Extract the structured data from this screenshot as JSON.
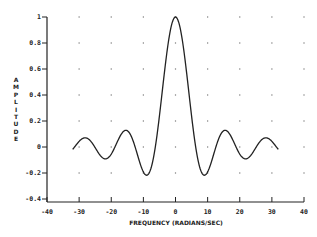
{
  "chart_data": {
    "type": "line",
    "title": "",
    "xlabel": "FREQUENCY (RADIANS/SEC)",
    "ylabel": "AMPLITUDE",
    "xlim": [
      -40,
      40
    ],
    "ylim": [
      -0.4,
      1
    ],
    "xticks": [
      -40,
      -30,
      -20,
      -10,
      0,
      10,
      20,
      30,
      40
    ],
    "xtick_labels": [
      "-40",
      "-30",
      "-20",
      "-10",
      "0",
      "10",
      "20",
      "30",
      "40"
    ],
    "yticks": [
      -0.4,
      -0.2,
      0,
      0.2,
      0.4,
      0.6,
      0.8,
      1
    ],
    "ytick_labels": [
      "-0.4",
      "-0.2",
      "0",
      "0.2",
      "0.4",
      "0.6",
      "0.8",
      "1"
    ],
    "grid": "dotted points at tick intersections",
    "legend": null,
    "series": [
      {
        "name": "sin(w/2)/(w/2)",
        "x": [
          -32,
          -28.1,
          -21.8,
          -15.45,
          -12.57,
          -8.99,
          -6.28,
          -3,
          0,
          3,
          6.28,
          8.99,
          12.57,
          15.45,
          21.8,
          28.1,
          32
        ],
        "values": [
          -0.018,
          0.071,
          -0.091,
          0.128,
          0,
          -0.217,
          0,
          0.665,
          1,
          0.665,
          0,
          -0.217,
          0,
          0.128,
          -0.091,
          0.071,
          -0.018
        ],
        "function": "sin(x/2)/(x/2)",
        "x_range": [
          -32,
          32
        ]
      }
    ]
  }
}
